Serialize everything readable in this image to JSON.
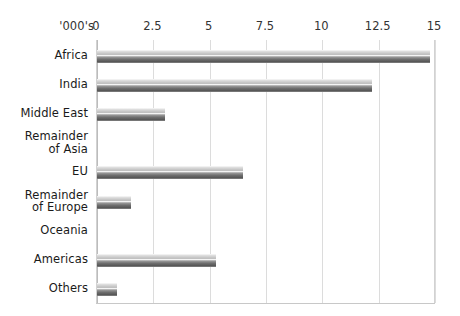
{
  "chart_data": {
    "type": "bar",
    "orientation": "horizontal",
    "title": "",
    "unit_label": "'000's",
    "xlabel": "",
    "ylabel": "",
    "xlim": [
      0,
      15
    ],
    "grid": true,
    "legend": "none",
    "xticks": [
      "0",
      "2.5",
      "5",
      "7.5",
      "10",
      "12.5",
      "15"
    ],
    "xtick_values": [
      0,
      2.5,
      5,
      7.5,
      10,
      12.5,
      15
    ],
    "categories": [
      "Africa",
      "India",
      "Middle East",
      "Remainder\nof Asia",
      "EU",
      "Remainder\nof Europe",
      "Oceania",
      "Americas",
      "Others"
    ],
    "values": [
      14.8,
      12.2,
      3.0,
      0,
      6.5,
      1.5,
      0,
      5.3,
      0.9
    ],
    "colors": {
      "bar_light": "#d5d5d5",
      "bar_dark": "#5d5d5d",
      "gridline": "#dcdcdc",
      "axis": "#c8c8c8",
      "text": "#1a1a1a",
      "background": "#ffffff"
    }
  }
}
